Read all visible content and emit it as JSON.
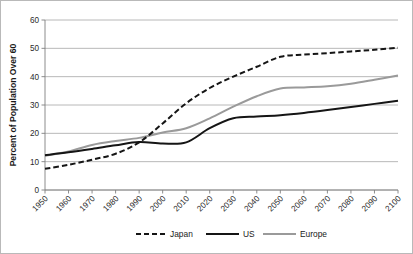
{
  "chart_data": {
    "type": "line",
    "title": "",
    "xlabel": "",
    "ylabel": "Percent of Population Over 60",
    "xlim": [
      1950,
      2100
    ],
    "ylim": [
      0,
      60
    ],
    "yticks": [
      0,
      10,
      20,
      30,
      40,
      50,
      60
    ],
    "grid": true,
    "legend_position": "bottom",
    "x": [
      1950,
      1960,
      1970,
      1980,
      1990,
      2000,
      2010,
      2020,
      2030,
      2040,
      2050,
      2060,
      2070,
      2080,
      2090,
      2100
    ],
    "categories": [
      "1950",
      "1960",
      "1970",
      "1980",
      "1990",
      "2000",
      "2010",
      "2020",
      "2030",
      "2040",
      "2050",
      "2060",
      "2070",
      "2080",
      "2090",
      "2100"
    ],
    "series": [
      {
        "name": "Japan",
        "color": "#151515",
        "style": "dashed",
        "values": [
          7.5,
          8.9,
          10.7,
          12.8,
          16.8,
          23.5,
          30.6,
          36.0,
          40.0,
          43.5,
          47.0,
          47.8,
          48.3,
          48.9,
          49.5,
          50.2
        ]
      },
      {
        "name": "US",
        "color": "#151515",
        "style": "solid",
        "values": [
          12.3,
          13.3,
          14.5,
          15.8,
          16.9,
          16.4,
          16.8,
          21.8,
          25.3,
          25.9,
          26.4,
          27.2,
          28.2,
          29.3,
          30.4,
          31.5
        ]
      },
      {
        "name": "Europe",
        "color": "#9a9a9a",
        "style": "solid",
        "values": [
          12.1,
          13.6,
          15.9,
          17.3,
          18.4,
          20.3,
          21.8,
          25.3,
          29.4,
          33.1,
          35.8,
          36.2,
          36.6,
          37.5,
          38.9,
          40.4
        ]
      }
    ]
  },
  "legend": {
    "entries": [
      {
        "label": "Japan"
      },
      {
        "label": "US"
      },
      {
        "label": "Europe"
      }
    ]
  },
  "axes": {
    "y_title": "Percent of Population Over 60",
    "y_tick_labels": [
      "60",
      "50",
      "40",
      "30",
      "20",
      "10",
      "0"
    ],
    "x_tick_labels": [
      "1950",
      "1960",
      "1970",
      "1980",
      "1990",
      "2000",
      "2010",
      "2020",
      "2030",
      "2040",
      "2050",
      "2060",
      "2070",
      "2080",
      "2090",
      "2100"
    ]
  }
}
